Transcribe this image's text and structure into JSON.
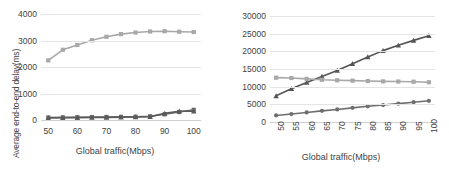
{
  "chart_data": [
    {
      "id": "left",
      "type": "line",
      "title": "",
      "xlabel": "Global  traffic(Mbps)",
      "ylabel": "Average end-to-end delay(ms)",
      "x": [
        50,
        55,
        60,
        65,
        70,
        75,
        80,
        85,
        90,
        95,
        100
      ],
      "xlim": [
        47.5,
        102.5
      ],
      "ylim": [
        0,
        4000
      ],
      "xticks": [
        50,
        60,
        70,
        80,
        90,
        100
      ],
      "yticks": [
        0,
        1000,
        2000,
        3000,
        4000
      ],
      "xtick_labels": [
        "50",
        "60",
        "70",
        "80",
        "90",
        "100"
      ],
      "ytick_labels": [
        "0",
        "1000",
        "2000",
        "3000",
        "4000"
      ],
      "xtick_rotation": 0,
      "grid": true,
      "legend": "none",
      "series": [
        {
          "name": "series-1-light-square",
          "marker": "square",
          "color": "#a8a8a8",
          "values": [
            2250,
            2650,
            2830,
            3010,
            3140,
            3240,
            3300,
            3340,
            3350,
            3330,
            3320
          ]
        },
        {
          "name": "series-2-dark-square",
          "marker": "square",
          "color": "#6b6b6b",
          "values": [
            95,
            100,
            105,
            110,
            115,
            120,
            125,
            140,
            215,
            300,
            385
          ]
        },
        {
          "name": "series-3-dark-triangle",
          "marker": "triangle",
          "color": "#5a5a5a",
          "values": [
            80,
            85,
            90,
            95,
            100,
            105,
            112,
            125,
            250,
            330,
            330
          ]
        }
      ]
    },
    {
      "id": "right",
      "type": "line",
      "title": "",
      "xlabel": "Global traffic(Mbps)",
      "ylabel": "Average throughput(Mbps)",
      "x": [
        50,
        55,
        60,
        65,
        70,
        75,
        80,
        85,
        90,
        95,
        100
      ],
      "xlim": [
        48,
        102
      ],
      "ylim": [
        0,
        30000
      ],
      "xticks": [
        50,
        55,
        60,
        65,
        70,
        75,
        80,
        85,
        90,
        95,
        100
      ],
      "yticks": [
        0,
        5000,
        10000,
        15000,
        20000,
        25000,
        30000
      ],
      "xtick_labels": [
        "50",
        "55",
        "60",
        "65",
        "70",
        "75",
        "80",
        "85",
        "90",
        "95",
        "100"
      ],
      "ytick_labels": [
        "0",
        "5000",
        "10000",
        "15000",
        "20000",
        "25000",
        "30000"
      ],
      "xtick_rotation": -90,
      "grid": true,
      "legend": "none",
      "series": [
        {
          "name": "series-1-dark-triangle",
          "marker": "triangle",
          "color": "#555555",
          "values": [
            7400,
            9400,
            11200,
            12900,
            14600,
            16500,
            18400,
            20200,
            21700,
            23100,
            24400
          ]
        },
        {
          "name": "series-2-light-square",
          "marker": "square",
          "color": "#a8a8a8",
          "values": [
            12550,
            12450,
            12200,
            11950,
            11800,
            11700,
            11600,
            11500,
            11450,
            11400,
            11250
          ]
        },
        {
          "name": "series-3-dark-circle",
          "marker": "circle",
          "color": "#6e6e6e",
          "values": [
            1850,
            2250,
            2700,
            3150,
            3550,
            4000,
            4450,
            4800,
            5200,
            5600,
            6000
          ]
        }
      ]
    }
  ]
}
